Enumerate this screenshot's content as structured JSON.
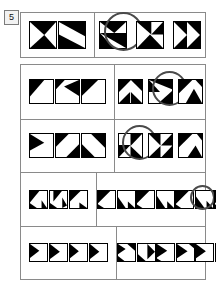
{
  "item": {
    "number": "5",
    "type": "nonverbal-matrix-reasoning"
  },
  "rows": [
    {
      "id": "row-1",
      "stem_tile_count": 2,
      "option_count": 3,
      "tiles_per_option": 1,
      "marked_option_index": 1,
      "tile_size": 26,
      "stem_tiles": [
        "t-arrow-left-pair-a",
        "t-arrow-left-pair-b"
      ],
      "options": [
        {
          "label": "A",
          "tiles": [
            "o1-a"
          ]
        },
        {
          "label": "B",
          "tiles": [
            "o1-b"
          ]
        },
        {
          "label": "C",
          "tiles": [
            "o1-c"
          ]
        }
      ]
    },
    {
      "id": "row-2",
      "stem_tile_count": 3,
      "option_count": 3,
      "tiles_per_option": 1,
      "marked_option_index": 2,
      "tile_size": 23,
      "stem_tiles": [
        "t2-1",
        "t2-2",
        "t2-3"
      ],
      "options": [
        {
          "label": "A",
          "tiles": [
            "o2-a"
          ]
        },
        {
          "label": "B",
          "tiles": [
            "o2-b"
          ]
        },
        {
          "label": "C",
          "tiles": [
            "o2-c"
          ]
        }
      ]
    },
    {
      "id": "row-3",
      "stem_tile_count": 3,
      "option_count": 3,
      "tiles_per_option": 1,
      "marked_option_index": 1,
      "tile_size": 23,
      "stem_tiles": [
        "t3-1",
        "t3-2",
        "t3-3"
      ],
      "options": [
        {
          "label": "A",
          "tiles": [
            "o3-a"
          ]
        },
        {
          "label": "B",
          "tiles": [
            "o3-b"
          ]
        },
        {
          "label": "C",
          "tiles": [
            "o3-c"
          ]
        }
      ]
    },
    {
      "id": "row-4",
      "stem_tile_count": 3,
      "option_count": 4,
      "tiles_per_option": 2,
      "marked_option_index": 3,
      "tile_size": 17,
      "stem_tiles": [
        "t4-1",
        "t4-2",
        "t4-3"
      ],
      "options": [
        {
          "label": "A",
          "tiles": [
            "o4-a1",
            "o4-a2"
          ]
        },
        {
          "label": "B",
          "tiles": [
            "o4-b1",
            "o4-b2"
          ]
        },
        {
          "label": "C",
          "tiles": [
            "o4-c1",
            "o4-c2"
          ]
        },
        {
          "label": "D",
          "tiles": [
            "o4-d1",
            "o4-d2"
          ]
        }
      ]
    },
    {
      "id": "row-5",
      "stem_tile_count": 4,
      "option_count": 4,
      "tiles_per_option": 2,
      "marked_option_index": 4,
      "tile_size": 17,
      "stem_tiles": [
        "t5-1",
        "t5-2",
        "t5-3",
        "t5-4"
      ],
      "options": [
        {
          "label": "A",
          "tiles": [
            "o5-a1",
            "o5-a2"
          ]
        },
        {
          "label": "B",
          "tiles": [
            "o5-b1",
            "o5-b2"
          ]
        },
        {
          "label": "C",
          "tiles": [
            "o5-c1",
            "o5-c2"
          ]
        },
        {
          "label": "D",
          "tiles": [
            "o5-d1",
            "o5-d2"
          ]
        }
      ]
    }
  ],
  "colors": {
    "ink": "#000000",
    "paper": "#ffffff",
    "rule": "#8a8a8a",
    "badge_fill": "#f2f2f2",
    "badge_border": "#7b7b7b",
    "mark": "#4a4a4a"
  },
  "tile_art": {
    "t-arrow-left-pair-a": [
      [
        0,
        0,
        100,
        0,
        55,
        50
      ],
      [
        0,
        100,
        100,
        100,
        55,
        50
      ]
    ],
    "t-arrow-left-pair-b": [
      [
        0,
        0,
        100,
        0,
        100,
        55
      ],
      [
        0,
        100,
        100,
        100,
        0,
        48
      ]
    ],
    "o1-a": [
      [
        0,
        0,
        100,
        0,
        55,
        42
      ],
      [
        0,
        42,
        100,
        42,
        100,
        100
      ],
      [
        0,
        42,
        0,
        100,
        52,
        100
      ]
    ],
    "o1-b": [
      [
        0,
        0,
        55,
        0,
        55,
        48
      ],
      [
        100,
        0,
        100,
        48,
        55,
        48
      ],
      [
        0,
        100,
        100,
        100,
        50,
        48
      ]
    ],
    "o1-c": [
      [
        0,
        0,
        50,
        0,
        50,
        50
      ],
      [
        50,
        0,
        100,
        0,
        100,
        50
      ],
      [
        0,
        100,
        50,
        100,
        50,
        50
      ],
      [
        50,
        100,
        100,
        100,
        100,
        50
      ]
    ],
    "t2-1": [
      [
        0,
        0,
        62,
        0,
        0,
        72
      ]
    ],
    "t2-2": [
      [
        100,
        0,
        100,
        70,
        35,
        28
      ],
      [
        0,
        0,
        38,
        0,
        0,
        40
      ]
    ],
    "t2-3": [
      [
        0,
        0,
        70,
        0,
        0,
        68
      ]
    ],
    "o2-a": [
      [
        0,
        0,
        52,
        0,
        0,
        52
      ],
      [
        52,
        0,
        100,
        0,
        100,
        48
      ],
      [
        0,
        100,
        48,
        100,
        48,
        52
      ],
      [
        52,
        52,
        100,
        100,
        52,
        100
      ]
    ],
    "o2-b": [
      [
        0,
        0,
        100,
        0,
        100,
        40
      ],
      [
        0,
        0,
        0,
        52,
        48,
        52
      ],
      [
        100,
        48,
        100,
        100,
        42,
        100
      ]
    ],
    "o2-c": [
      [
        0,
        0,
        58,
        0,
        0,
        58
      ],
      [
        30,
        100,
        65,
        38,
        100,
        100
      ],
      [
        100,
        0,
        100,
        30,
        72,
        0
      ]
    ],
    "t3-1": [
      [
        0,
        0,
        62,
        38,
        0,
        72
      ]
    ],
    "t3-2": [
      [
        0,
        0,
        55,
        0,
        0,
        55
      ],
      [
        100,
        45,
        100,
        100,
        45,
        100
      ]
    ],
    "t3-3": [
      [
        100,
        0,
        100,
        60,
        40,
        0
      ],
      [
        0,
        45,
        0,
        100,
        55,
        100
      ]
    ],
    "o3-a": [
      [
        50,
        0,
        100,
        0,
        50,
        52
      ],
      [
        0,
        48,
        50,
        48,
        0,
        100
      ],
      [
        50,
        52,
        100,
        100,
        50,
        100
      ]
    ],
    "o3-b": [
      [
        0,
        0,
        50,
        0,
        50,
        50
      ],
      [
        100,
        0,
        100,
        50,
        52,
        50
      ],
      [
        0,
        100,
        50,
        100,
        50,
        52
      ],
      [
        100,
        52,
        100,
        100,
        55,
        100
      ]
    ],
    "o3-c": [
      [
        0,
        0,
        58,
        0,
        0,
        58
      ],
      [
        38,
        100,
        72,
        50,
        100,
        100
      ],
      [
        100,
        0,
        100,
        28,
        78,
        0
      ]
    ],
    "t4-1": [
      [
        0,
        0,
        55,
        0,
        0,
        68
      ],
      [
        0,
        72,
        40,
        100,
        0,
        100
      ],
      [
        68,
        55,
        100,
        100,
        68,
        100
      ]
    ],
    "t4-2": [
      [
        20,
        0,
        70,
        0,
        20,
        62
      ],
      [
        0,
        70,
        42,
        100,
        0,
        100
      ],
      [
        72,
        38,
        100,
        85,
        72,
        100
      ]
    ],
    "t4-3": [
      [
        0,
        0,
        62,
        0,
        0,
        62
      ],
      [
        55,
        68,
        100,
        100,
        55,
        100
      ]
    ],
    "o4-a1": [
      [
        0,
        0,
        72,
        0,
        0,
        72
      ],
      [
        0,
        78,
        35,
        100,
        0,
        100
      ]
    ],
    "o4-a2": [
      [
        0,
        35,
        45,
        100,
        0,
        100
      ],
      [
        58,
        62,
        100,
        100,
        58,
        100
      ]
    ],
    "o4-b1": [
      [
        0,
        0,
        72,
        0,
        0,
        72
      ],
      [
        0,
        80,
        32,
        100,
        0,
        100
      ]
    ],
    "o4-b2": [
      [
        0,
        30,
        48,
        100,
        0,
        100
      ],
      [
        60,
        60,
        100,
        100,
        60,
        100
      ]
    ],
    "o4-c1": [
      [
        0,
        0,
        75,
        0,
        0,
        75
      ],
      [
        0,
        80,
        30,
        100,
        0,
        100
      ]
    ],
    "o4-c2": [
      [
        0,
        32,
        50,
        100,
        0,
        100
      ],
      [
        62,
        58,
        100,
        100,
        62,
        100
      ]
    ],
    "o4-d1": [
      [
        0,
        0,
        72,
        0,
        0,
        72
      ],
      [
        0,
        78,
        34,
        100,
        0,
        100
      ]
    ],
    "o4-d2": [
      [
        0,
        30,
        48,
        100,
        0,
        100
      ],
      [
        60,
        60,
        100,
        100,
        60,
        100
      ]
    ],
    "t5-1": [
      [
        0,
        0,
        55,
        40,
        0,
        82
      ]
    ],
    "t5-2": [
      [
        0,
        0,
        58,
        45,
        0,
        88
      ]
    ],
    "t5-3": [
      [
        0,
        0,
        52,
        42,
        0,
        84
      ]
    ],
    "t5-4": [
      [
        0,
        0,
        55,
        45,
        0,
        88
      ]
    ],
    "o5-a1": [
      [
        0,
        0,
        45,
        30,
        0,
        60
      ],
      [
        55,
        0,
        100,
        0,
        100,
        40
      ],
      [
        0,
        70,
        38,
        100,
        0,
        100
      ]
    ],
    "o5-a2": [
      [
        55,
        0,
        100,
        45,
        55,
        90
      ],
      [
        0,
        60,
        45,
        100,
        0,
        100
      ]
    ],
    "o5-b1": [
      [
        0,
        0,
        60,
        40,
        0,
        80
      ],
      [
        0,
        85,
        25,
        100,
        0,
        100
      ]
    ],
    "o5-b2": [
      [
        0,
        0,
        62,
        42,
        0,
        84
      ],
      [
        70,
        0,
        100,
        0,
        100,
        25
      ]
    ],
    "o5-c1": [
      [
        0,
        0,
        58,
        42,
        0,
        84
      ]
    ],
    "o5-c2": [
      [
        0,
        0,
        60,
        45,
        0,
        90
      ]
    ],
    "o5-d1": [
      [
        0,
        0,
        58,
        42,
        0,
        84
      ]
    ],
    "o5-d2": [
      [
        0,
        0,
        60,
        45,
        0,
        90
      ]
    ]
  }
}
